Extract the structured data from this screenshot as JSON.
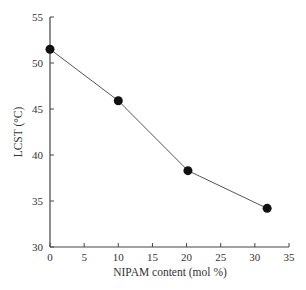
{
  "chart_data": {
    "type": "line",
    "title": "",
    "xlabel": "NIPAM content (mol %)",
    "ylabel": "LCST (°C)",
    "xlim": [
      0,
      35
    ],
    "ylim": [
      30,
      55
    ],
    "xticks": [
      "0",
      "5",
      "10",
      "15",
      "20",
      "25",
      "30",
      "35"
    ],
    "yticks": [
      "30",
      "35",
      "40",
      "45",
      "50",
      "55"
    ],
    "grid": false,
    "series": [
      {
        "name": "LCST",
        "x": [
          0,
          10,
          20.2,
          31.8
        ],
        "y": [
          51.5,
          45.9,
          38.3,
          34.2
        ],
        "marker": "filled-circle",
        "color": "#111111"
      }
    ]
  }
}
